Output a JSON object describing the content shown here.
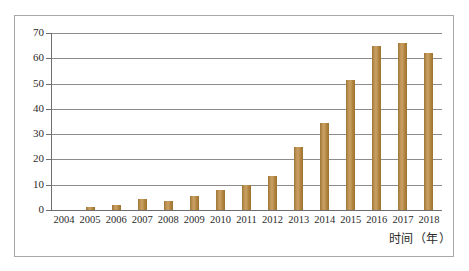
{
  "chart_data": {
    "type": "bar",
    "title": "",
    "xlabel": "时间（年）",
    "ylabel": "",
    "categories": [
      "2004",
      "2005",
      "2006",
      "2007",
      "2008",
      "2009",
      "2010",
      "2011",
      "2012",
      "2013",
      "2014",
      "2015",
      "2016",
      "2017",
      "2018"
    ],
    "values": [
      0,
      1,
      2,
      4.5,
      3.5,
      5.5,
      8,
      10,
      13.5,
      25,
      34.5,
      51.5,
      65,
      66,
      62
    ],
    "ylim": [
      0,
      70
    ],
    "yticks": [
      0,
      10,
      20,
      30,
      40,
      50,
      60,
      70
    ],
    "ytick_labels": [
      "0",
      "10",
      "20",
      "30",
      "40",
      "50",
      "60",
      "70"
    ],
    "grid": true,
    "legend": false,
    "series": [
      {
        "name": "",
        "values": [
          0,
          1,
          2,
          4.5,
          3.5,
          5.5,
          8,
          10,
          13.5,
          25,
          34.5,
          51.5,
          65,
          66,
          62
        ]
      }
    ],
    "colors": {
      "bar": "#b3853f",
      "gridline": "#8c8c8c",
      "axis": "#6e6e6e",
      "frame": "#a8a8a8",
      "text": "#2b2b2b",
      "background": "#ffffff"
    }
  }
}
